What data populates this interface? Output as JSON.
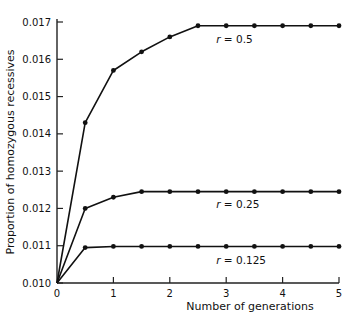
{
  "chart_data": {
    "type": "line",
    "title": "",
    "xlabel": "Number of generations",
    "ylabel": "Proportion of homozygous recessives",
    "xlim": [
      0,
      5
    ],
    "ylim": [
      0.01,
      0.017
    ],
    "xticks": [
      0,
      1,
      2,
      3,
      4,
      5
    ],
    "xtick_labels": [
      "0",
      "1",
      "2",
      "3",
      "4",
      "5"
    ],
    "yticks": [
      0.01,
      0.011,
      0.012,
      0.013,
      0.014,
      0.015,
      0.016,
      0.017
    ],
    "ytick_labels": [
      "0.010",
      "0.011",
      "0.012",
      "0.013",
      "0.014",
      "0.015",
      "0.016",
      "0.017"
    ],
    "grid": false,
    "legend": "inline labels",
    "x": [
      0,
      0.5,
      1,
      1.5,
      2,
      2.5,
      3,
      3.5,
      4,
      4.5,
      5
    ],
    "series": [
      {
        "name": "r = 0.5",
        "label": "r = 0.5",
        "values": [
          0.01,
          0.0143,
          0.0157,
          0.0162,
          0.0166,
          0.0169,
          0.0169,
          0.0169,
          0.0169,
          0.0169,
          0.0169
        ],
        "label_pos": [
          3.0,
          0.01655
        ]
      },
      {
        "name": "r = 0.25",
        "label": "r = 0.25",
        "values": [
          0.01,
          0.012,
          0.0123,
          0.01245,
          0.01245,
          0.01245,
          0.01245,
          0.01245,
          0.01245,
          0.01245,
          0.01245
        ],
        "label_pos": [
          3.0,
          0.01212
        ]
      },
      {
        "name": "r = 0.125",
        "label": "r = 0.125",
        "values": [
          0.01,
          0.01095,
          0.01098,
          0.01098,
          0.01098,
          0.01098,
          0.01098,
          0.01098,
          0.01098,
          0.01098,
          0.01098
        ],
        "label_pos": [
          3.0,
          0.01063
        ]
      }
    ]
  },
  "style": {
    "line_color": "#111111",
    "axis_color": "#222222"
  }
}
